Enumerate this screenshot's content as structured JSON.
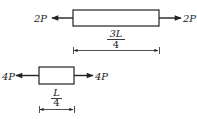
{
  "diagram": {
    "bar1": {
      "left_force": {
        "label": "2P",
        "direction": "left"
      },
      "right_force": {
        "label": "2P",
        "direction": "right"
      },
      "length": {
        "numerator": "3L",
        "denominator": "4"
      }
    },
    "bar2": {
      "left_force": {
        "label": "4P",
        "direction": "left"
      },
      "right_force": {
        "label": "4P",
        "direction": "right"
      },
      "length": {
        "numerator": "L",
        "denominator": "4"
      }
    },
    "colors": {
      "stroke": "#222222",
      "background": "#ffffff"
    }
  }
}
